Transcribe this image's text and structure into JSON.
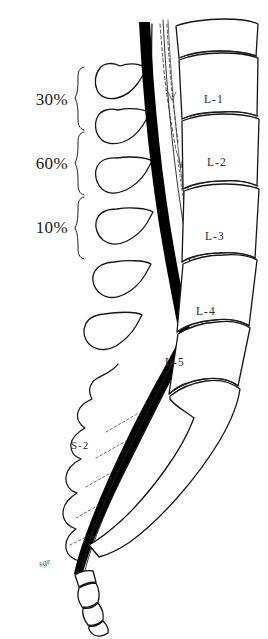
{
  "figure": {
    "name": "lumbosacral-spine-lateral-diagram",
    "background_color": "#ffffff",
    "ink_color": "#141414",
    "dura_color": "#000000"
  },
  "percent_brackets": [
    {
      "id": "bracket-30",
      "value": "30%",
      "span_top": 66,
      "span_bottom": 131
    },
    {
      "id": "bracket-60",
      "value": "60%",
      "span_top": 131,
      "span_bottom": 196
    },
    {
      "id": "bracket-10",
      "value": "10%",
      "span_top": 196,
      "span_bottom": 256
    }
  ],
  "vertebra_labels": [
    {
      "id": "label-l1",
      "text": "L-1",
      "x": 204,
      "y": 100
    },
    {
      "id": "label-l2",
      "text": "L-2",
      "x": 207,
      "y": 163
    },
    {
      "id": "label-l3",
      "text": "L-3",
      "x": 205,
      "y": 237
    },
    {
      "id": "label-l4",
      "text": "L-4",
      "x": 196,
      "y": 312
    },
    {
      "id": "label-l5",
      "text": "L-5",
      "x": 165,
      "y": 363
    }
  ],
  "sacral_labels": [
    {
      "id": "label-s2",
      "text": "S-2",
      "x": 71,
      "y": 446
    }
  ],
  "coccyx_labels": [
    {
      "id": "label-coccyx",
      "text": "sgr",
      "x": 39,
      "y": 565
    }
  ]
}
